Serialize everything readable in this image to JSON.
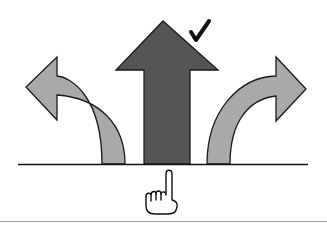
{
  "diagram": {
    "colors": {
      "background": "#ffffff",
      "outline": "#1a1a1a",
      "selected_arrow_fill": "#555555",
      "side_arrow_fill": "#a9a9a9",
      "divider": "#9a9a9a"
    },
    "arrows": [
      {
        "id": "left",
        "direction": "curve-left",
        "selected": false
      },
      {
        "id": "center",
        "direction": "straight-up",
        "selected": true
      },
      {
        "id": "right",
        "direction": "curve-right",
        "selected": false
      }
    ],
    "icons": {
      "check": "checkmark-icon",
      "hand": "pointing-hand-icon"
    }
  }
}
